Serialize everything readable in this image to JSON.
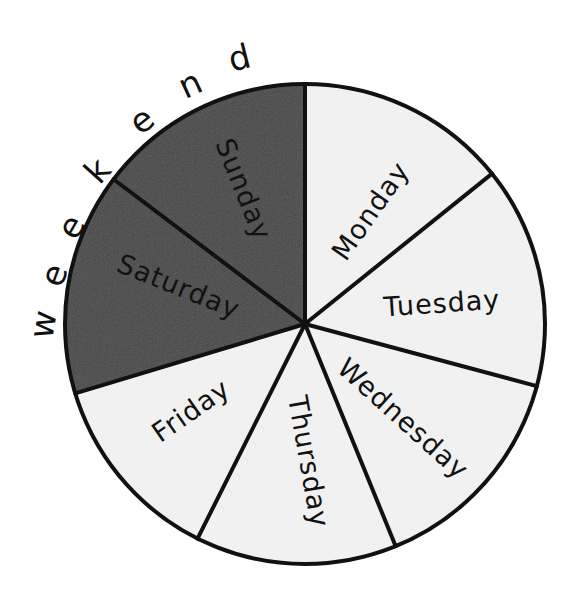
{
  "chart_data": {
    "type": "pie",
    "title": "",
    "categories": [
      "Monday",
      "Tuesday",
      "Wednesday",
      "Thursday",
      "Friday",
      "Saturday",
      "Sunday"
    ],
    "values": [
      1,
      1,
      1,
      1,
      1,
      1,
      1
    ],
    "measured_angles_deg": [
      51.2,
      53.8,
      52.8,
      48.8,
      46.6,
      53.9,
      52.9
    ],
    "start_angle_deg": 90,
    "direction": "clockwise",
    "slices": [
      {
        "label": "Monday",
        "start": 90,
        "end": 38.8,
        "fill": "#f1f1f1",
        "group": "weekday",
        "lx": 372,
        "ly": 212,
        "rot": -55
      },
      {
        "label": "Tuesday",
        "start": 38.8,
        "end": -15,
        "fill": "#f1f1f1",
        "group": "weekday",
        "lx": 442,
        "ly": 305,
        "rot": -4
      },
      {
        "label": "Wednesday",
        "start": -15,
        "end": -67.8,
        "fill": "#f1f1f1",
        "group": "weekday",
        "lx": 402,
        "ly": 420,
        "rot": 42
      },
      {
        "label": "Thursday",
        "start": -67.8,
        "end": -116.6,
        "fill": "#f1f1f1",
        "group": "weekday",
        "lx": 307,
        "ly": 462,
        "rot": 80
      },
      {
        "label": "Friday",
        "start": -116.6,
        "end": -163.2,
        "fill": "#f1f1f1",
        "group": "weekday",
        "lx": 192,
        "ly": 412,
        "rot": -35
      },
      {
        "label": "Saturday",
        "start": 196.8,
        "end": 142.9,
        "fill": "#474747",
        "group": "weekend",
        "lx": 178,
        "ly": 288,
        "rot": 22
      },
      {
        "label": "Sunday",
        "start": 142.9,
        "end": 90,
        "fill": "#474747",
        "group": "weekend",
        "lx": 242,
        "ly": 190,
        "rot": 68
      }
    ],
    "annotations": [
      {
        "text": "Weekend",
        "style": "curved text along outer arc spanning Saturday and Sunday",
        "letters": [
          "w",
          "e",
          "e",
          "k",
          "e",
          "n",
          "d"
        ]
      }
    ],
    "legend": null,
    "colors": {
      "weekday_fill": "#f1f1f1",
      "weekend_fill": "#474747",
      "outline": "#111111",
      "background": "#ffffff"
    },
    "geometry": {
      "cx": 305,
      "cy": 324,
      "r": 240
    }
  },
  "annotation": {
    "weekend_label": "Weekend",
    "weekend_letters": [
      {
        "ch": "w",
        "x": 45,
        "y": 325,
        "rot": -80
      },
      {
        "ch": "e",
        "x": 56,
        "y": 276,
        "rot": -70
      },
      {
        "ch": "e",
        "x": 73,
        "y": 228,
        "rot": -60
      },
      {
        "ch": "k",
        "x": 99,
        "y": 172,
        "rot": -48
      },
      {
        "ch": "e",
        "x": 143,
        "y": 122,
        "rot": -38
      },
      {
        "ch": "n",
        "x": 191,
        "y": 86,
        "rot": -25
      },
      {
        "ch": "d",
        "x": 240,
        "y": 60,
        "rot": -14
      }
    ]
  }
}
